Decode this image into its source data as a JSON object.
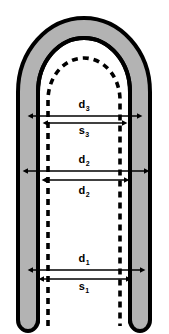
{
  "figure": {
    "kind": "technical-cross-section-diagram",
    "shape_description": "U-shaped (dome) cross-section with outer shell band, inner wall and dashed inner profile",
    "colors": {
      "background": "#ffffff",
      "shell_fill": "#b3b3b3",
      "outline": "#000000",
      "inner_fill": "#ffffff",
      "dashed_line": "#000000",
      "arrow": "#000000"
    }
  },
  "dimensions": [
    {
      "id": "d3",
      "symbol": "d",
      "subscript": "3",
      "label_x": 84,
      "label_y": 108,
      "arrow_y": 116,
      "arrow_x1": 33,
      "arrow_x2": 137,
      "arrow_style": "double",
      "measures": "solid-inner-wall"
    },
    {
      "id": "s3",
      "symbol": "s",
      "subscript": "3",
      "label_x": 84,
      "label_y": 134,
      "arrow_y": 123,
      "arrow_x1": 48,
      "arrow_x2": 122,
      "arrow_style": "double",
      "measures": "dashed-inner-profile"
    },
    {
      "id": "d2-upper",
      "symbol": "d",
      "subscript": "2",
      "label_x": 84,
      "label_y": 163,
      "arrow_y": 171,
      "arrow_x1": 28,
      "arrow_x2": 144,
      "arrow_style": "double",
      "measures": "solid-inner-wall"
    },
    {
      "id": "d2-lower",
      "symbol": "d",
      "subscript": "2",
      "label_x": 84,
      "label_y": 194,
      "arrow_y": 180,
      "arrow_x1": 47,
      "arrow_x2": 124,
      "arrow_style": "double",
      "measures": "dashed-inner-profile"
    },
    {
      "id": "d1",
      "symbol": "d",
      "subscript": "1",
      "label_x": 84,
      "label_y": 262,
      "arrow_y": 270,
      "arrow_x1": 33,
      "arrow_x2": 140,
      "arrow_style": "double",
      "measures": "solid-inner-wall"
    },
    {
      "id": "s1",
      "symbol": "s",
      "subscript": "1",
      "label_x": 84,
      "label_y": 290,
      "arrow_y": 279,
      "arrow_x1": 44,
      "arrow_x2": 126,
      "arrow_style": "double",
      "measures": "dashed-inner-profile"
    }
  ],
  "geometry": {
    "outer_shell_path": "M 18 320 L 18 92 A 66 74 0 0 1 150 92 L 150 320 A 10 11 0 0 1 130 320 L 130 92 A 46 54 0 0 0 38 92 L 38 320 A 10 11 0 0 1 18 320 Z",
    "inner_wall_path": "M 38 322 L 38 92 A 46 54 0 0 1 130 92 L 130 322",
    "dashed_profile_path": "M 48 326 L 48 100 A 36 42 0 0 1 120 100 L 120 326"
  }
}
